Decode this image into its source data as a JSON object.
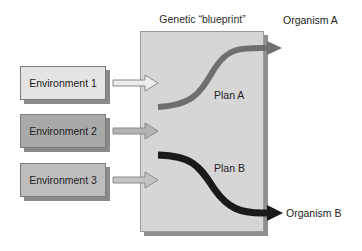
{
  "diagram": {
    "title": "Genetic “blueprint”",
    "environments": [
      {
        "label": "Environment 1",
        "fill": "#e4e4e4"
      },
      {
        "label": "Environment 2",
        "fill": "#a9a9a9"
      },
      {
        "label": "Environment 3",
        "fill": "#bdbdbd"
      }
    ],
    "plans": [
      {
        "label": "Plan A",
        "color": "#7a7a7a"
      },
      {
        "label": "Plan B",
        "color": "#1c1c1c"
      }
    ],
    "outcomes": [
      {
        "label": "Organism A"
      },
      {
        "label": "Organism B"
      }
    ],
    "colors": {
      "blueprint_fill": "#d6d6d6",
      "blueprint_shadow": "#8f8f8f",
      "input_arrow_fill": "#c8c8c8"
    }
  }
}
